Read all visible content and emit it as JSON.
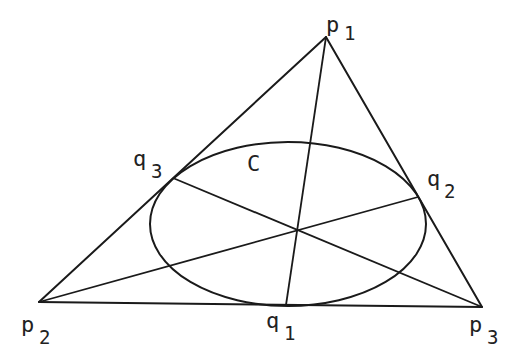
{
  "figure": {
    "conic_label": "C",
    "vertices": [
      {
        "id": "p1",
        "base": "p",
        "sub": "1"
      },
      {
        "id": "p2",
        "base": "p",
        "sub": "2"
      },
      {
        "id": "p3",
        "base": "p",
        "sub": "3"
      }
    ],
    "tangency_points": [
      {
        "id": "q1",
        "base": "q",
        "sub": "1",
        "on_side": "p2p3"
      },
      {
        "id": "q2",
        "base": "q",
        "sub": "2",
        "on_side": "p1p3"
      },
      {
        "id": "q3",
        "base": "q",
        "sub": "3",
        "on_side": "p1p2"
      }
    ],
    "cevians": [
      {
        "from": "p1",
        "to": "q1"
      },
      {
        "from": "p2",
        "to": "q2"
      },
      {
        "from": "p3",
        "to": "q3"
      }
    ],
    "colors": {
      "stroke": "#1a1a1a",
      "text": "#222222",
      "background": "#ffffff"
    }
  }
}
